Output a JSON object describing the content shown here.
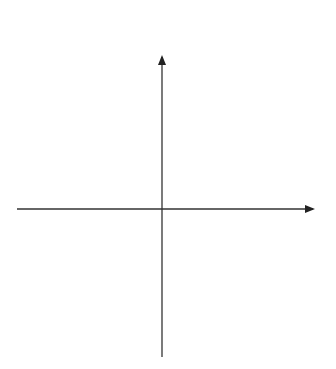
{
  "chart_data": {
    "type": "line",
    "title": "",
    "xlabel": "x",
    "ylabel": "y",
    "grid": false,
    "legend": "curve labels at top of each curve",
    "series": [
      {
        "name": "a",
        "color": "#e8473c",
        "shape": "even power, minimum at origin (x^2-like)",
        "passes_through": [
          [
            0,
            0
          ]
        ]
      },
      {
        "name": "b",
        "color": "#3a55a8",
        "shape": "odd power through origin (x^3-like), increasing",
        "passes_through": [
          [
            0,
            0
          ]
        ]
      },
      {
        "name": "c",
        "color": "#3f9a52",
        "shape": "even power shifted down, minimum below origin",
        "x_intercepts": [
          -0.67,
          0.67
        ]
      },
      {
        "name": "d",
        "color": "#f08a3c",
        "shape": "odd polynomial with local max left, local min right",
        "x_intercepts": [
          -1,
          0,
          1
        ]
      }
    ]
  },
  "axes": {
    "x_label": "x",
    "y_label": "y"
  },
  "labels": {
    "a": "a",
    "b": "b",
    "c": "c",
    "d": "d"
  }
}
